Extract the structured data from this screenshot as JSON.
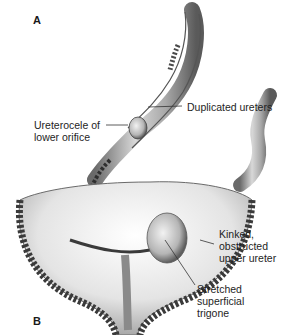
{
  "figure": {
    "panels": [
      {
        "letter": "A"
      },
      {
        "letter": "B"
      }
    ],
    "labels": {
      "ureterocele_line1": "Ureterocele of",
      "ureterocele_line2": "lower orifice",
      "duplicated": "Duplicated ureters",
      "kinked_line1": "Kinked,",
      "kinked_line2": "obstructed",
      "kinked_line3": "upper ureter",
      "trigone_line1": "Stretched",
      "trigone_line2": "superficial",
      "trigone_line3": "trigone"
    },
    "colors": {
      "background": "#ffffff",
      "tissue_light": "#d9d9d9",
      "tissue_mid": "#9a9a9a",
      "tissue_dark": "#3a3a3a",
      "leader_line": "#333333"
    }
  }
}
